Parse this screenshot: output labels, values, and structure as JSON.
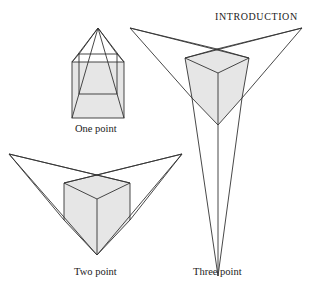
{
  "header": {
    "title": "INTRODUCTION"
  },
  "figures": [
    {
      "id": "one-point",
      "label": "One point"
    },
    {
      "id": "two-point",
      "label": "Two point"
    },
    {
      "id": "three-point",
      "label": "Three point"
    }
  ],
  "colors": {
    "line": "#333333",
    "fill": "#e6e6e6",
    "background": "#ffffff"
  }
}
